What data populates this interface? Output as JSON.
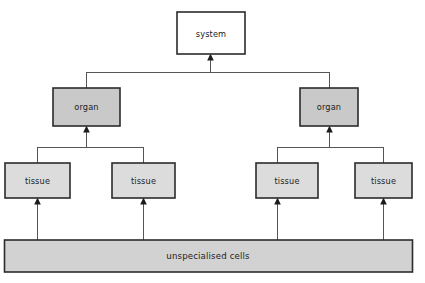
{
  "diagram": {
    "background_color": "#ffffff",
    "border_color": "#2b2b2b",
    "connector_color": "#555555",
    "arrow_color": "#1c1c1c",
    "levels": [
      {
        "id": "system",
        "fill": "#ffffff",
        "nodes": [
          {
            "id": "system-1",
            "label": "system"
          }
        ]
      },
      {
        "id": "organ",
        "fill": "#c9c9c9",
        "nodes": [
          {
            "id": "organ-left",
            "label": "organ"
          },
          {
            "id": "organ-right",
            "label": "organ"
          }
        ]
      },
      {
        "id": "tissue",
        "fill": "#dcdcdc",
        "nodes": [
          {
            "id": "tissue-1",
            "label": "tissue"
          },
          {
            "id": "tissue-2",
            "label": "tissue"
          },
          {
            "id": "tissue-3",
            "label": "tissue"
          },
          {
            "id": "tissue-4",
            "label": "tissue"
          }
        ]
      },
      {
        "id": "base",
        "fill": "#d2d2d2",
        "nodes": [
          {
            "id": "unspecialised-cells",
            "label": "unspecialised cells"
          }
        ]
      }
    ],
    "labels": {
      "system": "system",
      "organ_left": "organ",
      "organ_right": "organ",
      "tissue_1": "tissue",
      "tissue_2": "tissue",
      "tissue_3": "tissue",
      "tissue_4": "tissue",
      "base": "unspecialised cells"
    }
  }
}
